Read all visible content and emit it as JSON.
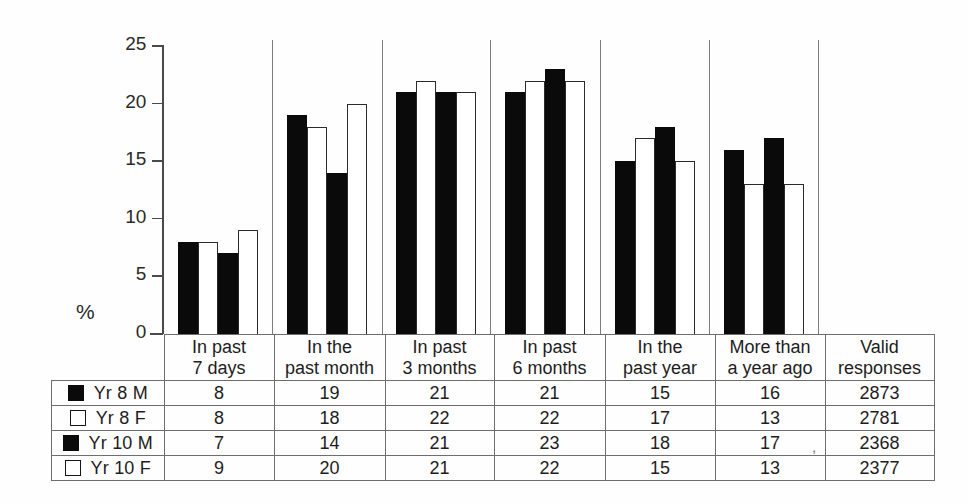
{
  "chart_data": {
    "type": "bar",
    "title": "",
    "xlabel": "",
    "ylabel": "%",
    "ylim": [
      0,
      25
    ],
    "yticks": [
      0,
      5,
      10,
      15,
      20,
      25
    ],
    "grid": false,
    "legend_position": "table-left-column",
    "categories": [
      "In past 7 days",
      "In the past month",
      "In past 3 months",
      "In past 6 months",
      "In the past year",
      "More than a year ago"
    ],
    "series": [
      {
        "name": "Yr 8 M",
        "swatch": "filled",
        "values": [
          8,
          19,
          21,
          21,
          15,
          16
        ],
        "valid_responses": 2873
      },
      {
        "name": "Yr 8 F",
        "swatch": "hollow",
        "values": [
          8,
          18,
          22,
          22,
          17,
          13
        ],
        "valid_responses": 2781
      },
      {
        "name": "Yr 10 M",
        "swatch": "filled",
        "values": [
          7,
          14,
          21,
          23,
          18,
          17
        ],
        "valid_responses": 2368
      },
      {
        "name": "Yr 10 F",
        "swatch": "hollow",
        "values": [
          9,
          20,
          21,
          22,
          15,
          13
        ],
        "valid_responses": 2377
      }
    ],
    "colors": {
      "filled": "#0a0a0a",
      "hollow": "#ffffff",
      "outline": "#2b2b2b",
      "axis": "#4a4a4a"
    }
  },
  "axis": {
    "y_unit_label": "%",
    "tick_labels": [
      "25",
      "20",
      "15",
      "10",
      "5",
      "0"
    ]
  },
  "table": {
    "column_headers": [
      {
        "line1": "In past",
        "line2": "7 days"
      },
      {
        "line1": "In the",
        "line2": "past month"
      },
      {
        "line1": "In past",
        "line2": "3 months"
      },
      {
        "line1": "In past",
        "line2": "6 months"
      },
      {
        "line1": "In the",
        "line2": "past year"
      },
      {
        "line1": "More than",
        "line2": "a year ago"
      },
      {
        "line1": "Valid",
        "line2": "responses"
      }
    ],
    "rows": [
      {
        "label": "Yr 8 M",
        "swatch": "filled",
        "cells": [
          "8",
          "19",
          "21",
          "21",
          "15",
          "16",
          "2873"
        ]
      },
      {
        "label": "Yr 8 F",
        "swatch": "hollow",
        "cells": [
          "8",
          "18",
          "22",
          "22",
          "17",
          "13",
          "2781"
        ]
      },
      {
        "label": "Yr 10 M",
        "swatch": "filled",
        "cells": [
          "7",
          "14",
          "21",
          "23",
          "18",
          "17",
          "2368"
        ]
      },
      {
        "label": "Yr 10 F",
        "swatch": "hollow",
        "cells": [
          "9",
          "20",
          "21",
          "22",
          "15",
          "13",
          "2377"
        ]
      }
    ],
    "stray_mark": ","
  }
}
